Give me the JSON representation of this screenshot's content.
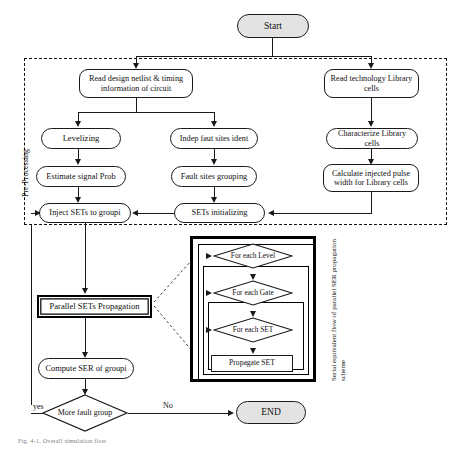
{
  "figure": {
    "caption": "Fig. 4-1.  Overall simulation flow",
    "preprocessing_label": "Pre-Processing",
    "inset_label": "Serial equivalent flow of parallel SER propagation scheme"
  },
  "terminals": {
    "start": "Start",
    "end": "END"
  },
  "preprocessing_nodes": [
    {
      "id": "read-netlist",
      "label": "Read design netlist & timing information of circuit"
    },
    {
      "id": "read-library",
      "label": "Read technology Library cells"
    },
    {
      "id": "levelizing",
      "label": "Levelizing"
    },
    {
      "id": "indep-fault-sites",
      "label": "Indep faut sites ident"
    },
    {
      "id": "characterize",
      "label": "Characterize Library cells"
    },
    {
      "id": "estimate-prob",
      "label": "Estimate signal Prob"
    },
    {
      "id": "fault-grouping",
      "label": "Fault sites grouping"
    },
    {
      "id": "calc-pulse-width",
      "label": "Calculate injected pulse width for Library cells"
    },
    {
      "id": "inject-sets",
      "label": "Inject SETs to groupi"
    },
    {
      "id": "sets-initializing",
      "label": "SETs initializing"
    }
  ],
  "main_nodes": [
    {
      "id": "parallel-propagation",
      "label": "Parallel SETs Propagation"
    },
    {
      "id": "compute-ser",
      "label": "Compute SER of  groupi"
    }
  ],
  "decision": {
    "label": "More fault group",
    "yes_label": "yes",
    "no_label": "No"
  },
  "inset_nodes": [
    {
      "id": "for-each-level",
      "label": "For each  Level"
    },
    {
      "id": "for-each-gate",
      "label": "For each  Gate"
    },
    {
      "id": "for-each-set",
      "label": "For each  SET"
    },
    {
      "id": "propagate-set",
      "label": "Propagate SET"
    }
  ],
  "colors": {
    "terminal_fill": "#e3e3e3",
    "stroke": "#1a1a1a",
    "node_fill": "#ffffff",
    "caption_text": "#7e7e7e"
  }
}
